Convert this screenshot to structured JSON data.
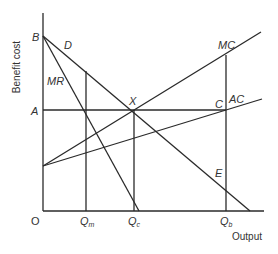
{
  "diagram": {
    "y_axis_label": "Benefit cost",
    "x_axis_label": "Output",
    "origin_label": "O",
    "points": {
      "B": "B",
      "D": "D",
      "MR": "MR",
      "A": "A",
      "X": "X",
      "MC": "MC",
      "C": "C",
      "AC": "AC",
      "E": "E"
    },
    "x_ticks": {
      "Qm": {
        "main": "Q",
        "sub": "m"
      },
      "Qc": {
        "main": "Q",
        "sub": "c"
      },
      "Qb": {
        "main": "Q",
        "sub": "b"
      }
    },
    "colors": {
      "line": "#2a2a2a",
      "text": "#333333",
      "background": "#ffffff"
    }
  }
}
